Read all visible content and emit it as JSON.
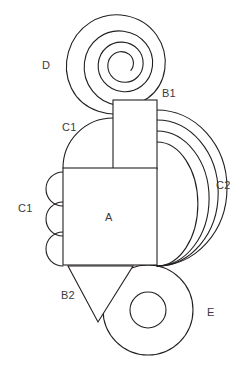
{
  "figure": {
    "title": "",
    "background_color": "#ffffff",
    "stroke_color": "#231f20",
    "label_color": "#3a3a3c"
  },
  "labels": {
    "d": "D",
    "b1": "B1",
    "c1_top": "C1",
    "c1_left": "C1",
    "c2": "C2",
    "a": "A",
    "b2": "B2",
    "e": "E"
  },
  "shapes": [
    {
      "id": "D",
      "name": "spiral",
      "label": "D",
      "center": [
        113,
        65
      ],
      "outer_radius": 48,
      "turns": 2
    },
    {
      "id": "B1",
      "name": "upper-rectangle",
      "label": "B1",
      "x": 113,
      "y": 100,
      "width": 44,
      "height": 69
    },
    {
      "id": "C1-top",
      "name": "large-arc-upper-left",
      "label": "C1",
      "center": [
        113,
        168
      ],
      "radius": 50
    },
    {
      "id": "C1-left",
      "name": "small-arcs-left",
      "label": "C1",
      "count": 3,
      "radius": 17
    },
    {
      "id": "C2",
      "name": "concentric-arcs-right",
      "label": "C2",
      "count": 4,
      "radii": [
        22,
        36,
        50,
        64
      ]
    },
    {
      "id": "A",
      "name": "main-rectangle",
      "label": "A",
      "x": 63,
      "y": 168,
      "width": 94,
      "height": 97
    },
    {
      "id": "B2",
      "name": "down-triangle",
      "label": "B2",
      "vertices": [
        [
          68,
          266
        ],
        [
          133,
          266
        ],
        [
          98,
          322
        ]
      ]
    },
    {
      "id": "E",
      "name": "annulus",
      "label": "E",
      "center": [
        148,
        310
      ],
      "outer_radius": 45,
      "inner_radius": 18
    }
  ]
}
